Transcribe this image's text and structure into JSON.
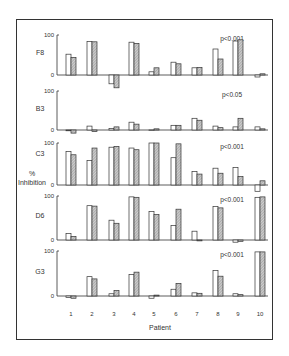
{
  "chart_data": {
    "type": "bar",
    "layout": "stacked-panels",
    "xlabel": "Patient",
    "ylabel": "% Inhibition",
    "categories": [
      "1",
      "2",
      "3",
      "4",
      "5",
      "6",
      "7",
      "8",
      "9",
      "10"
    ],
    "ytick_labels": [
      "0",
      "100"
    ],
    "ylim": [
      0,
      100
    ],
    "grid": false,
    "legend": null,
    "series_styles": [
      {
        "name": "open",
        "fill": "#ffffff",
        "stroke": "#333333"
      },
      {
        "name": "hatched",
        "fill": "hatched-grey",
        "stroke": "#333333"
      }
    ],
    "panels": [
      {
        "label": "F8",
        "pvalue": "p<0.001",
        "series": [
          {
            "name": "open",
            "values": [
              52,
              84,
              -22,
              82,
              8,
              32,
              18,
              65,
              85,
              -5
            ]
          },
          {
            "name": "hatched",
            "values": [
              44,
              83,
              -32,
              79,
              18,
              28,
              19,
              40,
              88,
              3
            ]
          }
        ]
      },
      {
        "label": "B3",
        "pvalue": "p<0.05",
        "series": [
          {
            "name": "open",
            "values": [
              -2,
              10,
              4,
              20,
              0,
              12,
              30,
              10,
              8,
              8
            ]
          },
          {
            "name": "hatched",
            "values": [
              -8,
              -4,
              8,
              15,
              3,
              12,
              25,
              6,
              30,
              3
            ]
          }
        ]
      },
      {
        "label": "C3",
        "pvalue": "p<0.001",
        "series": [
          {
            "name": "open",
            "values": [
              80,
              58,
              90,
              88,
              100,
              65,
              32,
              40,
              42,
              -15
            ]
          },
          {
            "name": "hatched",
            "values": [
              72,
              88,
              92,
              84,
              100,
              98,
              26,
              28,
              20,
              10
            ]
          }
        ]
      },
      {
        "label": "D6",
        "pvalue": "p<0.001",
        "series": [
          {
            "name": "open",
            "values": [
              15,
              78,
              45,
              98,
              65,
              33,
              20,
              76,
              -5,
              97
            ]
          },
          {
            "name": "hatched",
            "values": [
              8,
              77,
              38,
              97,
              58,
              70,
              -2,
              73,
              -3,
              98
            ]
          }
        ]
      },
      {
        "label": "G3",
        "pvalue": "p<0.001",
        "series": [
          {
            "name": "open",
            "values": [
              -3,
              43,
              5,
              48,
              -5,
              15,
              7,
              57,
              5,
              98
            ]
          },
          {
            "name": "hatched",
            "values": [
              -5,
              38,
              12,
              53,
              2,
              28,
              6,
              44,
              3,
              98
            ]
          }
        ]
      }
    ]
  },
  "labels": {
    "ylabel_line1": "%",
    "ylabel_line2": "Inhibition",
    "xlabel": "Patient"
  }
}
